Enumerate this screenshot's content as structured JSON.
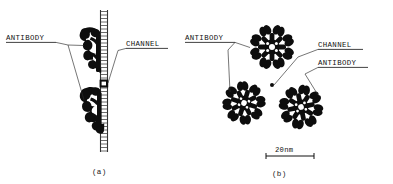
{
  "figure": {
    "background_color": "#ffffff",
    "ink_color": "#0d0d0d",
    "width": 393,
    "height": 184
  },
  "panel_a": {
    "caption": "(a)",
    "view": "side view / cross-section through membrane",
    "labels": {
      "antibody": "ANTIBODY",
      "channel": "CHANNEL"
    },
    "membrane": {
      "name": "lipid-bilayer",
      "orientation": "vertical",
      "top_y": 10,
      "bottom_y": 152,
      "x": 104
    },
    "antibody_count": 2,
    "channel_count": 1
  },
  "panel_b": {
    "caption": "(b)",
    "view": "face-on view of rosette complexes",
    "labels": {
      "antibody_left": "ANTIBODY",
      "channel": "CHANNEL",
      "antibody_right": "ANTIBODY"
    },
    "rosette_count": 3,
    "arms_per_rosette": 8,
    "scale_bar": {
      "text": "20nm",
      "length_px": 48,
      "x_start": 266,
      "x_end": 314,
      "y": 155
    }
  }
}
